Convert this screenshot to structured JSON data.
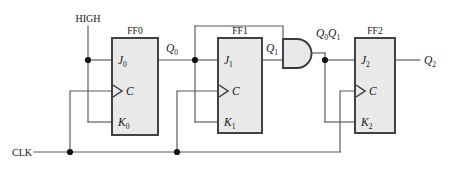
{
  "diagram": {
    "type": "logic-circuit-schematic",
    "colors": {
      "background": "#ffffff",
      "box_fill": "#e9e9e9",
      "box_stroke": "#3a3a3c",
      "wire": "#58585a",
      "junction_dot": "#111214",
      "text": "#151517"
    }
  },
  "inputs": {
    "high": "HIGH",
    "clk": "CLK"
  },
  "flipflops": [
    {
      "name": "FF0",
      "j": "J",
      "j_sub": "0",
      "c": "C",
      "k": "K",
      "k_sub": "0",
      "output": "Q",
      "output_sub": "0"
    },
    {
      "name": "FF1",
      "j": "J",
      "j_sub": "1",
      "c": "C",
      "k": "K",
      "k_sub": "1",
      "output": "Q",
      "output_sub": "1"
    },
    {
      "name": "FF2",
      "j": "J",
      "j_sub": "2",
      "c": "C",
      "k": "K",
      "k_sub": "2",
      "output": "Q",
      "output_sub": "2"
    }
  ],
  "gates": [
    {
      "type": "AND",
      "name": "and-gate-1",
      "inputs": [
        "Q0",
        "Q1"
      ],
      "output_label_a": "Q",
      "output_label_a_sub": "0",
      "output_label_b": "Q",
      "output_label_b_sub": "1"
    }
  ],
  "signals": {
    "q0": "Q",
    "q0_sub": "0",
    "q1": "Q",
    "q1_sub": "1",
    "q2": "Q",
    "q2_sub": "2",
    "and_out": "Q0Q1"
  }
}
